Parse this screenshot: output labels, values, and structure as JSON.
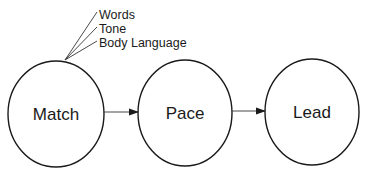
{
  "diagram": {
    "nodes": [
      {
        "id": "match",
        "label": "Match"
      },
      {
        "id": "pace",
        "label": "Pace"
      },
      {
        "id": "lead",
        "label": "Lead"
      }
    ],
    "edges": [
      {
        "from": "match",
        "to": "pace"
      },
      {
        "from": "pace",
        "to": "lead"
      }
    ],
    "annotations": [
      "Words",
      "Tone",
      "Body Language"
    ],
    "colors": {
      "stroke": "#1a1a1a",
      "background": "#ffffff"
    }
  }
}
